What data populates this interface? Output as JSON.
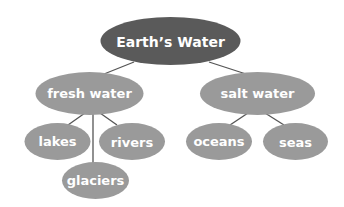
{
  "diagram": {
    "type": "concept-map",
    "colors": {
      "root_fill": "#5a5a5a",
      "node_fill": "#9a9a9a",
      "text": "#ffffff",
      "connector": "#555555",
      "background": "#ffffff"
    },
    "root": {
      "label": "Earth’s Water"
    },
    "nodes": {
      "fresh_water": {
        "label": "fresh water"
      },
      "salt_water": {
        "label": "salt water"
      },
      "lakes": {
        "label": "lakes"
      },
      "rivers": {
        "label": "rivers"
      },
      "glaciers": {
        "label": "glaciers"
      },
      "oceans": {
        "label": "oceans"
      },
      "seas": {
        "label": "seas"
      }
    },
    "edges": [
      [
        "Earth’s Water",
        "fresh water"
      ],
      [
        "Earth’s Water",
        "salt water"
      ],
      [
        "fresh water",
        "lakes"
      ],
      [
        "fresh water",
        "rivers"
      ],
      [
        "fresh water",
        "glaciers"
      ],
      [
        "salt water",
        "oceans"
      ],
      [
        "salt water",
        "seas"
      ]
    ]
  }
}
